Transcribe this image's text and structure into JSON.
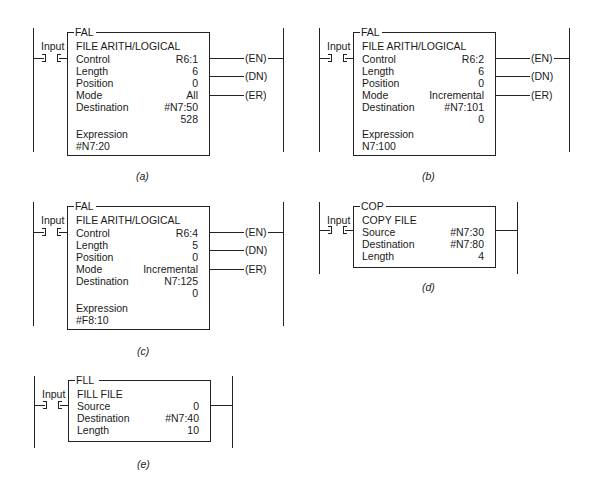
{
  "diagrams": {
    "a": {
      "caption": "(a)",
      "input_label": "Input",
      "instruction": "FAL",
      "title": "FILE ARITH/LOGICAL",
      "rows": [
        {
          "label": "Control",
          "value": "R6:1"
        },
        {
          "label": "Length",
          "value": "6"
        },
        {
          "label": "Position",
          "value": "0"
        },
        {
          "label": "Mode",
          "value": "All"
        },
        {
          "label": "Destination",
          "value": "#N7:50"
        },
        {
          "label": "",
          "value": "528"
        }
      ],
      "expression_label": "Expression",
      "expression_value": "#N7:20",
      "outputs": [
        "(EN)",
        "(DN)",
        "(ER)"
      ]
    },
    "b": {
      "caption": "(b)",
      "input_label": "Input",
      "instruction": "FAL",
      "title": "FILE ARITH/LOGICAL",
      "rows": [
        {
          "label": "Control",
          "value": "R6:2"
        },
        {
          "label": "Length",
          "value": "6"
        },
        {
          "label": "Position",
          "value": "0"
        },
        {
          "label": "Mode",
          "value": "Incremental"
        },
        {
          "label": "Destination",
          "value": "#N7:101"
        },
        {
          "label": "",
          "value": "0"
        }
      ],
      "expression_label": "Expression",
      "expression_value": "N7:100",
      "outputs": [
        "(EN)",
        "(DN)",
        "(ER)"
      ]
    },
    "c": {
      "caption": "(c)",
      "input_label": "Input",
      "instruction": "FAL",
      "title": "FILE ARITH/LOGICAL",
      "rows": [
        {
          "label": "Control",
          "value": "R6:4"
        },
        {
          "label": "Length",
          "value": "5"
        },
        {
          "label": "Position",
          "value": "0"
        },
        {
          "label": "Mode",
          "value": "Incremental"
        },
        {
          "label": "Destination",
          "value": "N7:125"
        },
        {
          "label": "",
          "value": "0"
        }
      ],
      "expression_label": "Expression",
      "expression_value": "#F8:10",
      "outputs": [
        "(EN)",
        "(DN)",
        "(ER)"
      ]
    },
    "d": {
      "caption": "(d)",
      "input_label": "Input",
      "instruction": "COP",
      "title": "COPY FILE",
      "rows": [
        {
          "label": "Source",
          "value": "#N7:30"
        },
        {
          "label": "Destination",
          "value": "#N7:80"
        },
        {
          "label": "Length",
          "value": "4"
        }
      ]
    },
    "e": {
      "caption": "(e)",
      "input_label": "Input",
      "instruction": "FLL",
      "title": "FILL FILE",
      "rows": [
        {
          "label": "Source",
          "value": "0"
        },
        {
          "label": "Destination",
          "value": "#N7:40"
        },
        {
          "label": "Length",
          "value": "10"
        }
      ]
    }
  }
}
